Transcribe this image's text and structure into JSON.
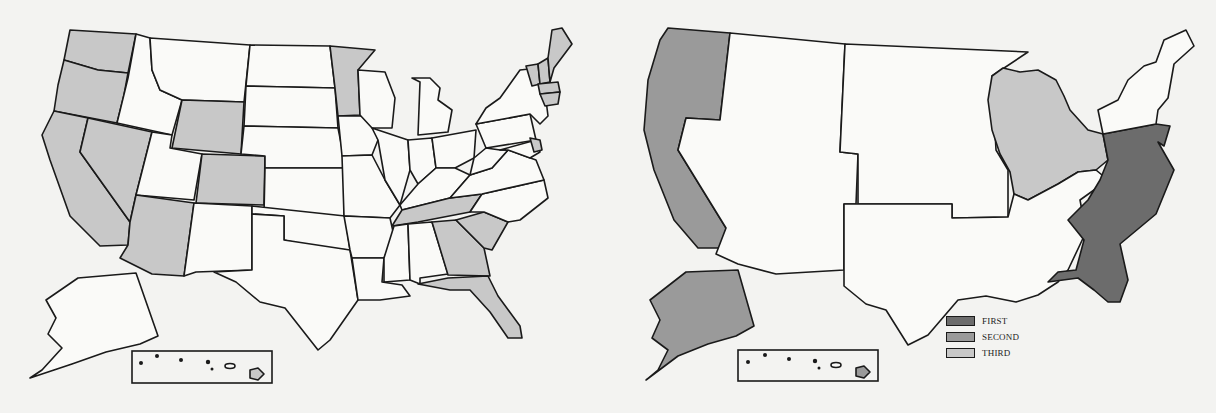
{
  "colors": {
    "background": "#f3f3f1",
    "outline": "#1a1a1a",
    "unshaded": "#fafaf8",
    "first": "#6c6c6c",
    "second": "#9a9a9a",
    "third": "#c8c8c8"
  },
  "left_map": {
    "title": "",
    "shaded_regions": [
      "Washington",
      "Oregon",
      "California",
      "Nevada",
      "Arizona",
      "Wyoming",
      "Colorado",
      "Minnesota",
      "Tennessee",
      "Georgia",
      "South Carolina",
      "Florida",
      "Maine",
      "New Hampshire",
      "Vermont",
      "Massachusetts",
      "Connecticut",
      "Rhode Island",
      "New Jersey",
      "Delaware",
      "Hawaii (Big Island)"
    ]
  },
  "right_map": {
    "regions": [
      {
        "name": "Pacific (WA, OR, CA)",
        "rank": "SECOND"
      },
      {
        "name": "Alaska",
        "rank": "SECOND"
      },
      {
        "name": "Hawaii",
        "rank": "SECOND"
      },
      {
        "name": "Great Lakes (WI, MI, IL, IN, OH)",
        "rank": "THIRD"
      },
      {
        "name": "South Atlantic (PA, MD, VA, NC, SC, GA, FL)",
        "rank": "FIRST"
      }
    ],
    "legend": [
      {
        "label": "FIRST",
        "color": "#6c6c6c"
      },
      {
        "label": "SECOND",
        "color": "#9a9a9a"
      },
      {
        "label": "THIRD",
        "color": "#c8c8c8"
      }
    ]
  }
}
